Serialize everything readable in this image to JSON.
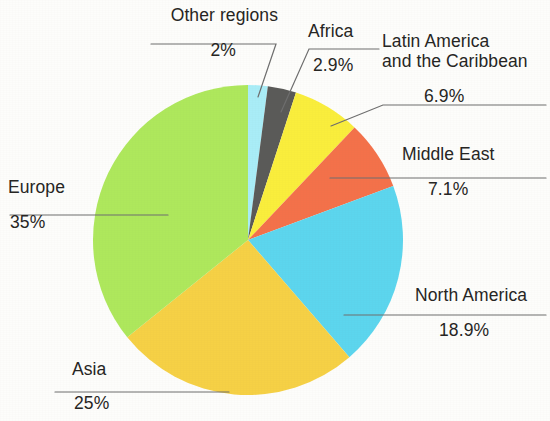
{
  "chart_data": {
    "type": "pie",
    "title": "",
    "subtitle": "",
    "xlabel": "",
    "ylabel": "",
    "legend_position": "callout-labels",
    "grid": false,
    "units": "percent",
    "categories": [
      "Other regions",
      "Africa",
      "Latin America and the Caribbean",
      "Middle East",
      "North America",
      "Asia",
      "Europe"
    ],
    "values": [
      2,
      2.9,
      6.9,
      7.1,
      18.9,
      25,
      35
    ],
    "value_labels": [
      "2%",
      "2.9%",
      "6.9%",
      "7.1%",
      "18.9%",
      "25%",
      "35%"
    ],
    "colors": [
      "#a9edf7",
      "#5a5a58",
      "#faee3c",
      "#f4714a",
      "#5cd6ee",
      "#f6d145",
      "#aee85c"
    ],
    "start_angle_deg": 0,
    "direction": "clockwise",
    "slices": [
      {
        "name": "Other regions",
        "value": 2,
        "label": "2%",
        "color": "#a9edf7"
      },
      {
        "name": "Africa",
        "value": 2.9,
        "label": "2.9%",
        "color": "#5a5a58"
      },
      {
        "name": "Latin America and the Caribbean",
        "value": 6.9,
        "label": "6.9%",
        "color": "#faee3c"
      },
      {
        "name": "Middle East",
        "value": 7.1,
        "label": "7.1%",
        "color": "#f4714a"
      },
      {
        "name": "North America",
        "value": 18.9,
        "label": "18.9%",
        "color": "#5cd6ee"
      },
      {
        "name": "Asia",
        "value": 25,
        "label": "25%",
        "color": "#f6d145"
      },
      {
        "name": "Europe",
        "value": 35,
        "label": "35%",
        "color": "#aee85c"
      }
    ]
  },
  "labels": {
    "other_regions": {
      "name": "Other regions",
      "value": "2%"
    },
    "africa": {
      "name": "Africa",
      "value": "2.9%"
    },
    "latin_america": {
      "name_line1": "Latin America",
      "name_line2": "and the Caribbean",
      "value": "6.9%"
    },
    "middle_east": {
      "name": "Middle East",
      "value": "7.1%"
    },
    "north_america": {
      "name": "North America",
      "value": "18.9%"
    },
    "asia": {
      "name": "Asia",
      "value": "25%"
    },
    "europe": {
      "name": "Europe",
      "value": "35%"
    }
  },
  "style": {
    "background": "#fdfdfb",
    "leader_line_color": "#6e6e6e",
    "text_color": "#262523"
  }
}
